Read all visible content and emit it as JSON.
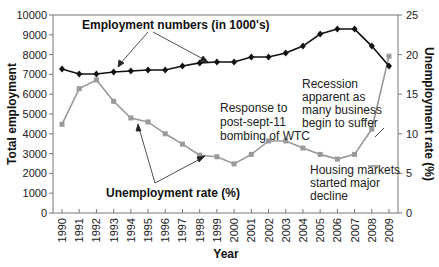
{
  "chart_data": {
    "type": "line",
    "title": "",
    "xlabel": "Year",
    "ylabel": "Total employment",
    "ylabel_right": "Unemployment rate (%)",
    "x": [
      "1990",
      "1991",
      "1992",
      "1993",
      "1994",
      "1995",
      "1996",
      "1997",
      "1998",
      "1999",
      "2000",
      "2001",
      "2002",
      "2003",
      "2004",
      "2005",
      "2006",
      "2007",
      "2008",
      "2009"
    ],
    "ylim": [
      0,
      10000
    ],
    "ylim_right": [
      0,
      25
    ],
    "yticks": [
      "0",
      "1000",
      "2000",
      "3000",
      "4000",
      "5000",
      "6000",
      "7000",
      "8000",
      "9000",
      "10000"
    ],
    "yticks_right": [
      "0",
      "5",
      "10",
      "15",
      "20",
      "25"
    ],
    "grid": false,
    "series": [
      {
        "name": "Employment numbers (in 1000's)",
        "axis": "left",
        "color": "#111111",
        "marker": "diamond",
        "values": [
          7270,
          7020,
          7020,
          7120,
          7170,
          7220,
          7220,
          7420,
          7580,
          7630,
          7630,
          7880,
          7880,
          8080,
          8430,
          9040,
          9290,
          9290,
          8430,
          7420
        ]
      },
      {
        "name": "Unemployment rate (%)",
        "axis": "right",
        "color": "#999999",
        "marker": "square",
        "values": [
          11.2,
          15.7,
          16.8,
          14.1,
          12.0,
          11.5,
          10.0,
          8.7,
          7.3,
          7.1,
          6.2,
          7.4,
          9.1,
          9.1,
          8.2,
          7.4,
          6.8,
          7.4,
          10.6,
          19.8
        ]
      }
    ],
    "annotations": [
      {
        "text": "Employment numbers (in 1000's)",
        "bold": true
      },
      {
        "text": "Unemployment rate (%)",
        "bold": true
      },
      {
        "lines": [
          "Response to",
          "post-sept-11",
          "bombing of WTC"
        ]
      },
      {
        "lines": [
          "Recession",
          "apparent as",
          "many business",
          "begin to suffer"
        ]
      },
      {
        "lines": [
          "Housing markets",
          "started major",
          "decline"
        ]
      }
    ]
  }
}
